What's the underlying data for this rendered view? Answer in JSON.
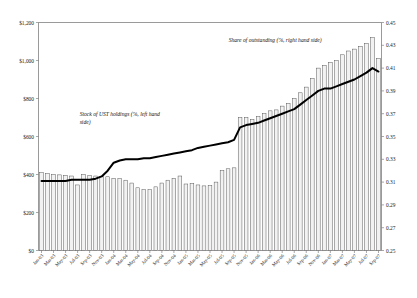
{
  "chart_data": {
    "type": "bar",
    "title": "",
    "subtitle": "",
    "xlabel": "",
    "ylabel": "",
    "grid": false,
    "legend_position": "inline-annotations",
    "annotations": [
      {
        "id": "bars-annotation",
        "text": "Stock of UST holdings (%, left hand side)",
        "x_frac": 0.12,
        "y_frac": 0.41
      },
      {
        "id": "line-annotation",
        "text": "Share of outstanding (%, right hand side)",
        "x_frac": 0.69,
        "y_frac": 0.085
      }
    ],
    "axes": {
      "left": {
        "label": "",
        "min": 0,
        "max": 1200,
        "step": 200,
        "tick_labels": [
          "$0",
          "$200",
          "$400",
          "$600",
          "$800",
          "$1,000",
          "$1,200"
        ],
        "tick_values": [
          0,
          200,
          400,
          600,
          800,
          1000,
          1200
        ],
        "series": "Stock of UST holdings"
      },
      "right": {
        "label": "",
        "min": 0.25,
        "max": 0.45,
        "step": 0.02,
        "tick_labels": [
          "0.25",
          "0.27",
          "0.29",
          "0.31",
          "0.33",
          "0.35",
          "0.37",
          "0.39",
          "0.41",
          "0.43",
          "0.45"
        ],
        "tick_values": [
          0.25,
          0.27,
          0.29,
          0.31,
          0.33,
          0.35,
          0.37,
          0.39,
          0.41,
          0.43,
          0.45
        ],
        "series": "Share of outstanding"
      }
    },
    "categories": [
      "Jan-03",
      "Feb-03",
      "Mar-03",
      "Apr-03",
      "May-03",
      "Jun-03",
      "Jul-03",
      "Aug-03",
      "Sep-03",
      "Oct-03",
      "Nov-03",
      "Dec-03",
      "Jan-04",
      "Feb-04",
      "Mar-04",
      "Apr-04",
      "May-04",
      "Jun-04",
      "Jul-04",
      "Aug-04",
      "Sep-04",
      "Oct-04",
      "Nov-04",
      "Dec-04",
      "Jan-05",
      "Feb-05",
      "Mar-05",
      "Apr-05",
      "May-05",
      "Jun-05",
      "Jul-05",
      "Aug-05",
      "Sep-05",
      "Oct-05",
      "Nov-05",
      "Dec-05",
      "Jan-06",
      "Feb-06",
      "Mar-06",
      "Apr-06",
      "May-06",
      "Jun-06",
      "Jul-06",
      "Aug-06",
      "Sep-06",
      "Oct-06",
      "Nov-06",
      "Dec-06",
      "Jan-07",
      "Feb-07",
      "Mar-07",
      "Apr-07",
      "May-07",
      "Jun-07",
      "Jul-07",
      "Aug-07",
      "Sep-07"
    ],
    "x_tick_labels": [
      "Jan-03",
      "Mar-03",
      "May-03",
      "Jul-03",
      "Sep-03",
      "Nov-03",
      "Jan-04",
      "Mar-04",
      "May-04",
      "Jul-04",
      "Sep-04",
      "Nov-04",
      "Jan-05",
      "Mar-05",
      "May-05",
      "Jul-05",
      "Sep-05",
      "Nov-05",
      "Jan-06",
      "Mar-06",
      "May-06",
      "Jul-06",
      "Sep-06",
      "Nov-06",
      "Jan-07",
      "Mar-07",
      "May-07",
      "Jul-07",
      "Sep-07"
    ],
    "x_tick_indices": [
      0,
      2,
      4,
      6,
      8,
      10,
      12,
      14,
      16,
      18,
      20,
      22,
      24,
      26,
      28,
      30,
      32,
      34,
      36,
      38,
      40,
      42,
      44,
      46,
      48,
      50,
      52,
      54,
      56
    ],
    "series": [
      {
        "name": "Stock of UST holdings",
        "type": "bar",
        "axis": "left",
        "unit": "$bn",
        "fill": "#f2f2f2",
        "stroke": "#4a4a4a",
        "values": [
          410,
          405,
          400,
          398,
          396,
          392,
          345,
          400,
          395,
          392,
          390,
          388,
          380,
          378,
          370,
          355,
          330,
          320,
          320,
          335,
          355,
          370,
          380,
          392,
          350,
          352,
          345,
          340,
          342,
          360,
          420,
          430,
          435,
          700,
          700,
          690,
          705,
          720,
          735,
          740,
          760,
          775,
          800,
          830,
          860,
          905,
          960,
          975,
          990,
          1000,
          1030,
          1050,
          1060,
          1075,
          1090,
          1120,
          1010
        ]
      },
      {
        "name": "Share of outstanding",
        "type": "line",
        "axis": "right",
        "unit": "fraction",
        "stroke": "#000000",
        "values": [
          0.311,
          0.311,
          0.311,
          0.311,
          0.311,
          0.312,
          0.312,
          0.312,
          0.312,
          0.313,
          0.315,
          0.32,
          0.327,
          0.329,
          0.33,
          0.33,
          0.33,
          0.331,
          0.331,
          0.332,
          0.333,
          0.334,
          0.335,
          0.336,
          0.337,
          0.338,
          0.34,
          0.341,
          0.342,
          0.343,
          0.344,
          0.345,
          0.347,
          0.358,
          0.36,
          0.361,
          0.362,
          0.364,
          0.366,
          0.368,
          0.37,
          0.372,
          0.374,
          0.378,
          0.382,
          0.386,
          0.39,
          0.392,
          0.392,
          0.394,
          0.396,
          0.398,
          0.4,
          0.403,
          0.406,
          0.41,
          0.407
        ]
      }
    ]
  }
}
